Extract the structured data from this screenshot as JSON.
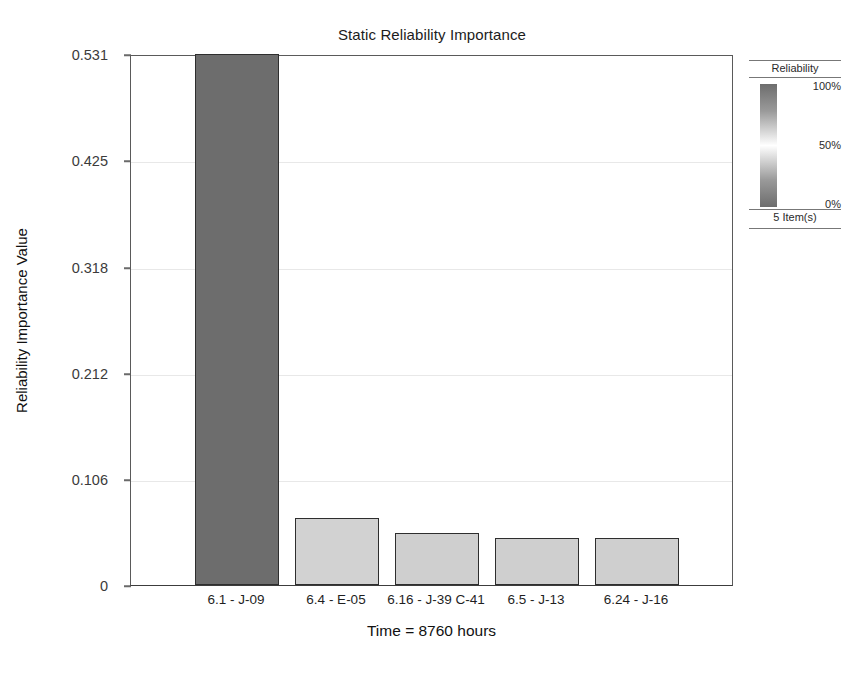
{
  "chart_data": {
    "type": "bar",
    "title": "Static Reliability Importance",
    "xlabel": "Time = 8760 hours",
    "ylabel": "Reliability Importance Value",
    "categories": [
      "6.1 - J-09",
      "6.4 - E-05",
      "6.16 - J-39 C-41",
      "6.5 - J-13",
      "6.24 - J-16"
    ],
    "values": [
      0.531,
      0.067,
      0.052,
      0.047,
      0.047
    ],
    "ylim": [
      0,
      0.531
    ],
    "yticks": [
      "0",
      "0.106",
      "0.212",
      "0.318",
      "0.425",
      "0.531"
    ],
    "ytick_values": [
      0,
      0.106,
      0.212,
      0.318,
      0.425,
      0.531
    ],
    "grid": true,
    "legend_position": "right",
    "bar_colors": [
      "#6d6d6d",
      "#d2d2d2",
      "#cfcfcf",
      "#cfcfcf",
      "#cfcfcf"
    ],
    "bar_border_color": "#2e2e2e"
  },
  "legend": {
    "title": "Reliability",
    "scale_top": "100%",
    "scale_mid": "50%",
    "scale_bottom": "0%",
    "footer": "5 Item(s)",
    "gradient_high_color": "#6d6d6d",
    "gradient_mid_color": "#ffffff",
    "gradient_low_color": "#6d6d6d"
  }
}
